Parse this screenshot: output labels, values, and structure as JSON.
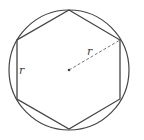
{
  "diagram": {
    "stroke_color": "#444444",
    "dash_color": "#777777",
    "circle": {
      "cx": 69,
      "cy": 70,
      "r": 60
    },
    "hexagon_points": "69,10 120,40 120,99 69,129 17,99 17,40",
    "center": {
      "x": 69,
      "y": 70
    },
    "radius_line": {
      "x1": 69,
      "y1": 70,
      "x2": 120,
      "y2": 40
    },
    "labels": {
      "radius": "r",
      "side": "r"
    }
  }
}
